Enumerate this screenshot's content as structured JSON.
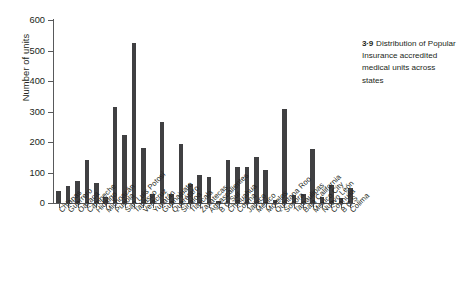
{
  "chart_data": {
    "type": "bar",
    "title": "",
    "xlabel": "",
    "ylabel": "Number of units",
    "ylim": [
      0,
      600
    ],
    "yticks": [
      0,
      100,
      200,
      300,
      400,
      500,
      600
    ],
    "grid": false,
    "legend": null,
    "bar_color": "#404042",
    "axis_color": "#58595b",
    "categories": [
      "Chiapas",
      "Guerrero",
      "Oaxaca",
      "Campeche",
      "Hidalgo",
      "Michoacán",
      "Puebla",
      "San Luis Potosí",
      "Tabasco",
      "Veracruz",
      "Yucatán",
      "Guanajuato",
      "Querétaro",
      "Sinaloa",
      "Tlaxcala",
      "Zacatecas",
      "Aguascalientes",
      "B C Sur",
      "Chihuahua",
      "Colima",
      "Jalisco",
      "México",
      "Morelos",
      "Quintana Roo",
      "Sonora",
      "Tamaulipas",
      "Baja California",
      "Mexico City",
      "Nuevo León",
      "Coahuila",
      "B C S",
      "Colima"
    ],
    "values": [
      38,
      55,
      72,
      140,
      65,
      20,
      315,
      222,
      525,
      182,
      30,
      267,
      28,
      193,
      62,
      93,
      85,
      8,
      142,
      118,
      117,
      150,
      108,
      10,
      308,
      25,
      30,
      178,
      20,
      58,
      15,
      48
    ]
  },
  "caption": {
    "number": "3·9",
    "text": "Distribution of Popular Insurance accredited medical units across states"
  }
}
